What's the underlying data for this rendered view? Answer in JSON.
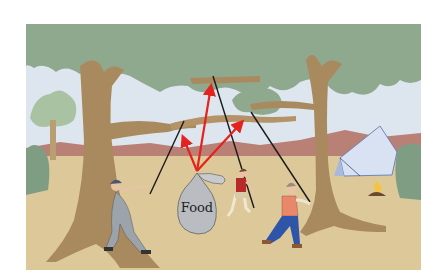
{
  "illustration": {
    "description": "Three people pull ropes over tree branches to hoist a food bag; red force vectors from the bag's knot",
    "bag_label": "Food",
    "colors": {
      "background": "#ffffff",
      "sky": "#dde6ee",
      "foliage": "#8fa98f",
      "trunk": "#a98a5e",
      "mountain": "#b98076",
      "ground": "#dcc899",
      "bag": "#b9bcc0",
      "force_arrow": "#e5231e",
      "rope": "#1a1a1a",
      "tent": "#d8e2f2",
      "shirt_red_person": "#b8292a",
      "shirt_right_person": "#e8876a",
      "jeans_right_person": "#2f55a8",
      "overalls_left_person": "#9da3ab"
    },
    "force_vectors": [
      {
        "name": "vertical",
        "from": [
          197,
          171
        ],
        "to": [
          212,
          80
        ]
      },
      {
        "name": "left",
        "from": [
          197,
          171
        ],
        "to": [
          180,
          131
        ]
      },
      {
        "name": "right",
        "from": [
          197,
          171
        ],
        "to": [
          247,
          117
        ]
      }
    ]
  }
}
